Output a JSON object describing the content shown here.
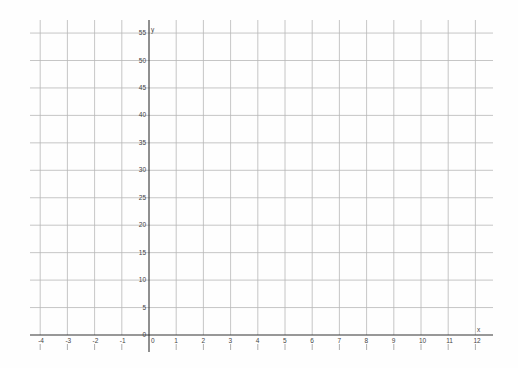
{
  "chart_data": {
    "type": "line",
    "title": "",
    "xlabel": "x",
    "ylabel": "y",
    "xlim": [
      -4.3,
      12.6
    ],
    "ylim": [
      -3,
      57
    ],
    "x_ticks": [
      -4,
      -3,
      -2,
      -1,
      0,
      1,
      2,
      3,
      4,
      5,
      6,
      7,
      8,
      9,
      10,
      11,
      12
    ],
    "y_ticks": [
      0,
      5,
      10,
      15,
      20,
      25,
      30,
      35,
      40,
      45,
      50,
      55
    ],
    "grid": true,
    "series": [],
    "legend": null
  },
  "colors": {
    "background": "#fefefe",
    "grid": "#b8b8b8",
    "axis": "#333333",
    "label": "#444444"
  }
}
